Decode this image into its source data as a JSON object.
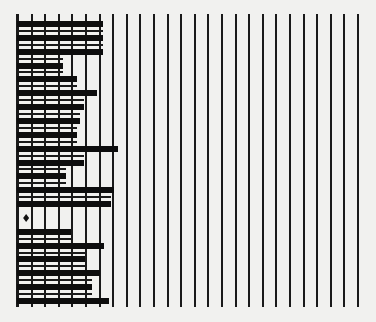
{
  "chart_data": {
    "type": "bar",
    "orientation": "horizontal",
    "title": "",
    "xlabel": "",
    "ylabel": "",
    "grid": {
      "vertical_lines": 26,
      "x_start_px": 17,
      "spacing_px": 13.6,
      "top_px": 14,
      "bottom_px": 307
    },
    "xlim": [
      0,
      25
    ],
    "categories": [
      "1",
      "2",
      "3",
      "4",
      "5",
      "6",
      "7",
      "8",
      "9",
      "10",
      "11",
      "12",
      "13",
      "14",
      "15",
      "16",
      "17",
      "18",
      "19",
      "20",
      "21"
    ],
    "values": [
      6.3,
      6.3,
      6.3,
      3.4,
      4.4,
      5.9,
      4.9,
      4.6,
      4.4,
      7.4,
      4.9,
      3.6,
      7.1,
      6.9,
      0,
      4.0,
      6.4,
      5.0,
      6.1,
      5.5,
      6.8
    ],
    "annotations": [
      {
        "row": 15,
        "type": "diamond-marker",
        "x": 0.45
      }
    ],
    "row_pitch_px": 13.85,
    "first_row_center_px": 24,
    "bar_height_px": 6,
    "colors": {
      "bar": "#0d0d0d",
      "grid": "#1a1a1a",
      "background": "#f1f1ef"
    }
  }
}
